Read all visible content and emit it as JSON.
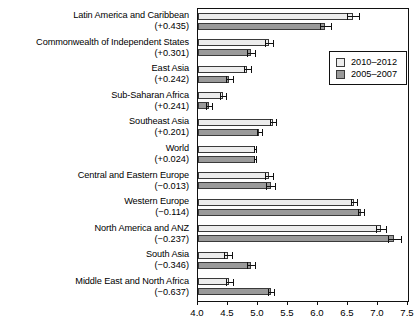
{
  "chart_data": {
    "type": "bar",
    "orientation": "horizontal",
    "title": "",
    "xlabel": "",
    "ylabel": "",
    "xlim": [
      4.0,
      7.5
    ],
    "grid": false,
    "legend_position": "top-right",
    "xticks": [
      "4.0",
      "4.5",
      "5.0",
      "5.5",
      "6.0",
      "6.5",
      "7.0",
      "7.5"
    ],
    "xtick_values": [
      4.0,
      4.5,
      5.0,
      5.5,
      6.0,
      6.5,
      7.0,
      7.5
    ],
    "legend": [
      "2010–2012",
      "2005–2007"
    ],
    "series": [
      {
        "name": "2010–2012",
        "color": "#ededed",
        "values": [
          6.58,
          5.18,
          4.82,
          4.42,
          5.25,
          4.95,
          5.18,
          6.6,
          7.05,
          4.5,
          4.52
        ],
        "errors": [
          0.1,
          0.07,
          0.06,
          0.05,
          0.05,
          0.02,
          0.07,
          0.05,
          0.09,
          0.06,
          0.06
        ]
      },
      {
        "name": "2005–2007",
        "color": "#9a9a9a",
        "values": [
          6.12,
          4.88,
          4.52,
          4.18,
          5.02,
          4.95,
          5.21,
          6.72,
          7.27,
          4.88,
          5.22
        ],
        "errors": [
          0.09,
          0.07,
          0.06,
          0.05,
          0.04,
          0.02,
          0.07,
          0.05,
          0.11,
          0.07,
          0.05
        ]
      }
    ],
    "categories": [
      {
        "name": "Latin America and Caribbean",
        "delta": "(+0.435)"
      },
      {
        "name": "Commonwealth of Independent States",
        "delta": "(+0.301)"
      },
      {
        "name": "East Asia",
        "delta": "(+0.242)"
      },
      {
        "name": "Sub-Saharan Africa",
        "delta": "(+0.241)"
      },
      {
        "name": "Southeast Asia",
        "delta": "(+0.201)"
      },
      {
        "name": "World",
        "delta": "(+0.024)"
      },
      {
        "name": "Central and Eastern Europe",
        "delta": "(−0.013)"
      },
      {
        "name": "Western Europe",
        "delta": "(−0.114)"
      },
      {
        "name": "North America and ANZ",
        "delta": "(−0.237)"
      },
      {
        "name": "South Asia",
        "delta": "(−0.346)"
      },
      {
        "name": "Middle East and North Africa",
        "delta": "(−0.637)"
      }
    ]
  }
}
